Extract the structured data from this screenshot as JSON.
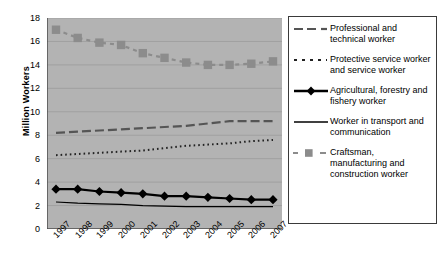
{
  "chart_data": {
    "type": "line",
    "title": "",
    "xlabel": "",
    "ylabel": "Million Workers",
    "ylim": [
      0,
      18
    ],
    "ytick_step": 2,
    "yticks": [
      "18",
      "16",
      "14",
      "12",
      "10",
      "8",
      "6",
      "4",
      "2",
      "0"
    ],
    "grid": true,
    "legend_position": "right",
    "plot_background": "#b3b3b3",
    "categories": [
      "1997",
      "1998",
      "1999",
      "2000",
      "2001",
      "2002",
      "2003",
      "2004",
      "2005",
      "2006",
      "2007"
    ],
    "series": [
      {
        "name": "Craftsman, manufacturing and construction worker",
        "style": "dashed-with-square-markers",
        "color": "#8c8c8c",
        "marker": "square",
        "values": [
          17.0,
          16.3,
          15.9,
          15.7,
          15.0,
          14.6,
          14.2,
          14.0,
          14.0,
          14.1,
          14.3
        ]
      },
      {
        "name": "Professional and technical worker",
        "style": "long-dash",
        "color": "#555555",
        "marker": "none",
        "values": [
          8.2,
          8.3,
          8.4,
          8.5,
          8.6,
          8.7,
          8.8,
          9.0,
          9.2,
          9.2,
          9.2
        ]
      },
      {
        "name": "Protective service worker and service worker",
        "style": "dotted",
        "color": "#222222",
        "marker": "none",
        "values": [
          6.3,
          6.4,
          6.5,
          6.6,
          6.7,
          6.9,
          7.1,
          7.2,
          7.3,
          7.5,
          7.6
        ]
      },
      {
        "name": "Agricultural, forestry and fishery worker",
        "style": "solid-thick-with-diamond-markers",
        "color": "#000000",
        "marker": "diamond",
        "values": [
          3.4,
          3.4,
          3.2,
          3.1,
          3.0,
          2.8,
          2.8,
          2.7,
          2.6,
          2.5,
          2.5
        ]
      },
      {
        "name": "Worker in transport and communication",
        "style": "solid-thin",
        "color": "#000000",
        "marker": "none",
        "values": [
          2.3,
          2.2,
          2.15,
          2.1,
          2.0,
          1.95,
          1.9,
          1.9,
          1.9,
          1.9,
          1.9
        ]
      }
    ]
  },
  "axis": {
    "y_title": "Million Workers"
  },
  "legend": {
    "entries": [
      {
        "label": "Professional and technical worker",
        "key": "long-dash-key"
      },
      {
        "label": "Protective service worker and service worker",
        "key": "dotted-key"
      },
      {
        "label": "Agricultural, forestry and fishery worker",
        "key": "solid-diamond-key"
      },
      {
        "label": "Worker in transport and communication",
        "key": "solid-thin-key"
      },
      {
        "label": "Craftsman, manufacturing and construction worker",
        "key": "dashed-square-key"
      }
    ]
  }
}
